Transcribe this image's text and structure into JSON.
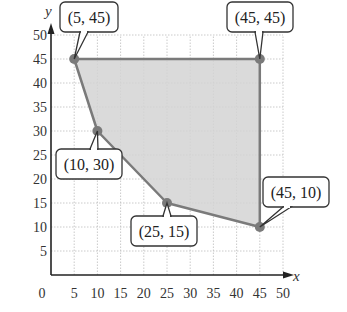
{
  "chart_data": {
    "type": "area",
    "title": "",
    "xlabel": "x",
    "ylabel": "y",
    "xlim": [
      0,
      50
    ],
    "ylim": [
      0,
      50
    ],
    "grid": true,
    "x_ticks": [
      "0",
      "5",
      "10",
      "15",
      "20",
      "25",
      "30",
      "35",
      "40",
      "45",
      "50"
    ],
    "y_ticks": [
      "5",
      "10",
      "15",
      "20",
      "25",
      "30",
      "35",
      "40",
      "45",
      "50"
    ],
    "region": {
      "description": "Shaded feasible region (polygon)",
      "vertices": [
        [
          5,
          45
        ],
        [
          45,
          45
        ],
        [
          45,
          10
        ],
        [
          25,
          15
        ],
        [
          10,
          30
        ]
      ],
      "fill_color": "#d3d3d3",
      "edge_color": "#7a7a7a"
    },
    "points": [
      {
        "x": 5,
        "y": 45,
        "label": "(5, 45)"
      },
      {
        "x": 45,
        "y": 45,
        "label": "(45, 45)"
      },
      {
        "x": 45,
        "y": 10,
        "label": "(45, 10)"
      },
      {
        "x": 25,
        "y": 15,
        "label": "(25, 15)"
      },
      {
        "x": 10,
        "y": 30,
        "label": "(10, 30)"
      }
    ]
  }
}
